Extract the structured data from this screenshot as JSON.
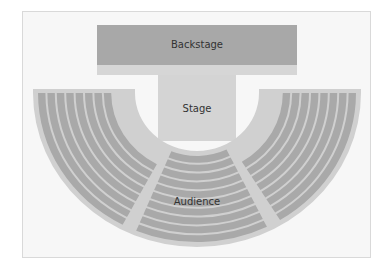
{
  "diagram": {
    "type": "theater-seating-plan",
    "areas": {
      "backstage": {
        "label": "Backstage"
      },
      "stage": {
        "label": "Stage"
      },
      "audience": {
        "label": "Audience"
      }
    },
    "audience_sections": [
      {
        "name": "left",
        "rows": 8
      },
      {
        "name": "center",
        "rows": 10
      },
      {
        "name": "right",
        "rows": 8
      }
    ],
    "colors": {
      "frame_bg": "#f7f7f7",
      "backstage": "#a8a8a8",
      "backstage_strip": "#d6d6d6",
      "stage": "#d4d4d4",
      "audience_bg": "#d0d0d0",
      "seats": "#a9a9a9",
      "aisle": "#d2d2d2",
      "text": "#333333"
    }
  }
}
